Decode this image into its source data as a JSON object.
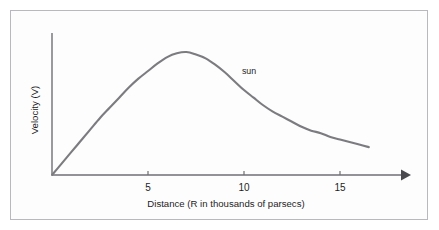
{
  "figure": {
    "background_color": "#fdfdfd",
    "frame_color": "#b9b9bd"
  },
  "chart_data": {
    "type": "line",
    "title": "",
    "subtitle": "",
    "xlabel": "Distance (R in thousands of parsecs)",
    "ylabel": "Velocity (V)",
    "xlim": [
      0,
      18.6
    ],
    "ylim": [
      0,
      1.12
    ],
    "grid": false,
    "legend_position": "none",
    "xticks": [
      5,
      10,
      15
    ],
    "xtick_labels": [
      "5",
      "10",
      "15"
    ],
    "yticks": [],
    "ytick_labels": [],
    "curve_color": "#7c7c80",
    "axis_color": "#6f6f74",
    "annotations": [
      {
        "text": "sun",
        "x": 10.2,
        "y": 0.83,
        "description": "label marking the Sun's position along the galactic rotation curve"
      }
    ],
    "series": [
      {
        "name": "Galactic rotation curve",
        "x": [
          0.0,
          0.5,
          1.0,
          1.5,
          2.0,
          2.5,
          3.0,
          3.5,
          4.0,
          4.5,
          5.0,
          5.5,
          6.0,
          6.5,
          7.0,
          7.5,
          8.0,
          8.5,
          9.0,
          9.5,
          10.0,
          10.5,
          11.0,
          11.5,
          12.0,
          12.5,
          13.0,
          13.5,
          14.0,
          14.5,
          15.0,
          15.5,
          16.0,
          16.5
        ],
        "y": [
          0.0,
          0.09,
          0.18,
          0.27,
          0.36,
          0.45,
          0.53,
          0.61,
          0.69,
          0.76,
          0.82,
          0.88,
          0.93,
          0.96,
          0.97,
          0.95,
          0.92,
          0.87,
          0.81,
          0.74,
          0.67,
          0.61,
          0.55,
          0.5,
          0.46,
          0.42,
          0.38,
          0.35,
          0.33,
          0.3,
          0.28,
          0.26,
          0.24,
          0.22
        ]
      }
    ]
  }
}
